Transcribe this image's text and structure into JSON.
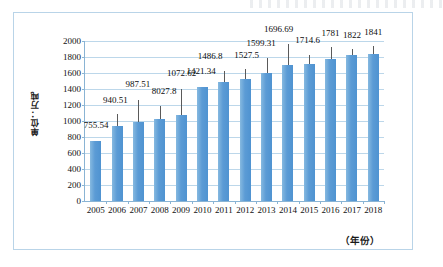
{
  "figure": {
    "y_axis_title": "单位：万吨",
    "x_axis_title": "（年份）"
  },
  "chart_data": {
    "type": "bar",
    "title": "",
    "xlabel": "（年份）",
    "ylabel": "单位：万吨",
    "categories": [
      "2005",
      "2006",
      "2007",
      "2008",
      "2009",
      "2010",
      "2011",
      "2012",
      "2013",
      "2014",
      "2015",
      "2016",
      "2017",
      "2018"
    ],
    "values": [
      755.54,
      940.51,
      987.51,
      1027.8,
      1072.62,
      1421.34,
      1486.8,
      1527.5,
      1599.31,
      1696.69,
      1714.6,
      1781,
      1822,
      1841
    ],
    "data_labels": [
      "755.54",
      "940.51",
      "987.51",
      "8027.8",
      "1072.62",
      "1421.34",
      "1486.8",
      "1527.5",
      "1599.31",
      "1696.69",
      "1714.6",
      "1781",
      "1822",
      "1841"
    ],
    "ylim": [
      0,
      2000
    ],
    "ytick_labels": [
      "2000",
      "1800",
      "1600",
      "1400",
      "1200",
      "1000",
      "800",
      "600",
      "400",
      "200",
      "0"
    ],
    "ytick_values": [
      2000,
      1800,
      1600,
      1400,
      1200,
      1000,
      800,
      600,
      400,
      200,
      0
    ],
    "grid": true,
    "legend": "none",
    "bar_color": "#5b9bd5",
    "gridline_color": "#bcd7ea",
    "axis_color": "#8ab4d4",
    "frame_color": "#b9d4e8"
  }
}
